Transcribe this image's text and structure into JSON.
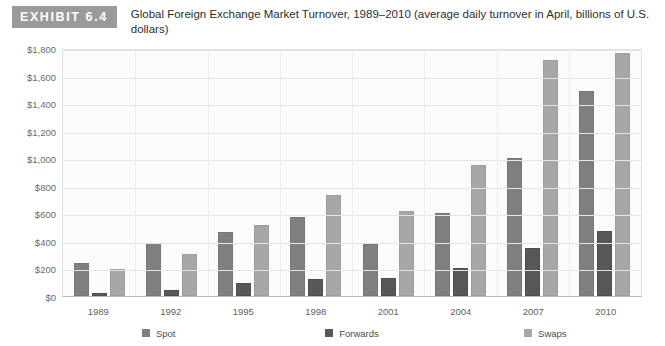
{
  "header": {
    "exhibit_tag": "EXHIBIT 6.4",
    "title": "Global Foreign Exchange Market Turnover, 1989–2010 (average daily turnover in April, billions of U.S. dollars)"
  },
  "legend": {
    "items": [
      {
        "label": "Spot",
        "color": "#7f7f7f",
        "swatch_name": "legend-swatch-spot"
      },
      {
        "label": "Forwards",
        "color": "#585858",
        "swatch_name": "legend-swatch-forwards"
      },
      {
        "label": "Swaps",
        "color": "#a6a6a6",
        "swatch_name": "legend-swatch-swaps"
      }
    ]
  },
  "chart_data": {
    "type": "bar",
    "title": "Global Foreign Exchange Market Turnover, 1989–2010 (average daily turnover in April, billions of U.S. dollars)",
    "xlabel": "",
    "ylabel": "",
    "categories": [
      "1989",
      "1992",
      "1995",
      "1998",
      "2001",
      "2004",
      "2007",
      "2010"
    ],
    "series": [
      {
        "name": "Spot",
        "color": "#7f7f7f",
        "values": [
          240,
          385,
          465,
          570,
          380,
          600,
          1000,
          1490
        ]
      },
      {
        "name": "Forwards",
        "color": "#585858",
        "values": [
          25,
          45,
          95,
          125,
          130,
          200,
          350,
          475
        ]
      },
      {
        "name": "Swaps",
        "color": "#a6a6a6",
        "values": [
          195,
          305,
          515,
          735,
          620,
          950,
          1715,
          1765
        ]
      }
    ],
    "ylim": [
      0,
      1800
    ],
    "ytick_values": [
      0,
      200,
      400,
      600,
      800,
      1000,
      1200,
      1400,
      1600,
      1800
    ],
    "ytick_labels": [
      "$0",
      "$200",
      "$400",
      "$600",
      "$800",
      "$1,000",
      "$1,200",
      "$1,400",
      "$1,600",
      "$1,800"
    ],
    "grid": true,
    "legend_position": "bottom"
  }
}
